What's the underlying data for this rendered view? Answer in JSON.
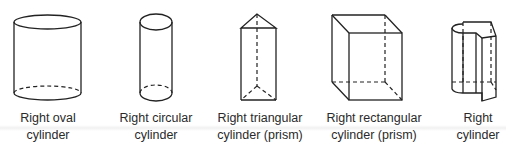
{
  "figure": {
    "shapes": [
      {
        "id": "oval",
        "label_line1": "Right oval",
        "label_line2": "cylinder"
      },
      {
        "id": "circular",
        "label_line1": "Right circular",
        "label_line2": "cylinder"
      },
      {
        "id": "triangular",
        "label_line1": "Right triangular",
        "label_line2": "cylinder (prism)"
      },
      {
        "id": "rectangular",
        "label_line1": "Right rectangular",
        "label_line2": "cylinder (prism)"
      },
      {
        "id": "general",
        "label_line1": "Right",
        "label_line2": "cylinder"
      }
    ],
    "colors": {
      "line": "#222222",
      "text": "#2a2a2a",
      "background": "#ffffff"
    }
  }
}
